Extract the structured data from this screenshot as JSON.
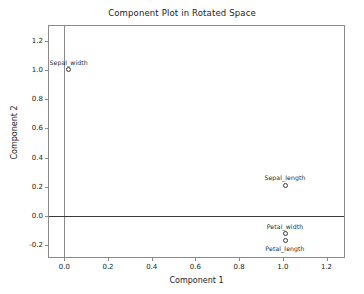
{
  "chart_data": {
    "type": "scatter",
    "title": "Component Plot in Rotated Space",
    "xlabel": "Component 1",
    "ylabel": "Component 2",
    "xlim": [
      -0.07,
      1.28
    ],
    "ylim": [
      -0.28,
      1.3
    ],
    "xticks": [
      "0.0",
      "0.2",
      "0.4",
      "0.6",
      "0.8",
      "1.0",
      "1.2"
    ],
    "xtick_values": [
      0.0,
      0.2,
      0.4,
      0.6,
      0.8,
      1.0,
      1.2
    ],
    "yticks": [
      "-0.2",
      "0.0",
      "0.2",
      "0.4",
      "0.6",
      "0.8",
      "1.0",
      "1.2"
    ],
    "ytick_values": [
      -0.2,
      0.0,
      0.2,
      0.4,
      0.6,
      0.8,
      1.0,
      1.2
    ],
    "grid": false,
    "legend": "none",
    "reference_lines": [
      {
        "axis": "x",
        "value": 0.0
      },
      {
        "axis": "y",
        "value": 0.0
      }
    ],
    "marker": "open-circle",
    "points": [
      {
        "label": "Sepal_width",
        "x": 0.02,
        "y": 1.0,
        "label_pos": "above"
      },
      {
        "label": "Sepal_length",
        "x": 1.01,
        "y": 0.21,
        "label_pos": "above"
      },
      {
        "label": "Petal_width",
        "x": 1.01,
        "y": -0.12,
        "label_pos": "above"
      },
      {
        "label": "Petal_length",
        "x": 1.01,
        "y": -0.17,
        "label_pos": "below"
      }
    ]
  },
  "colors": {
    "frame": "#8a8a8a",
    "reference_line": "#3a3a3a",
    "marker": "#3b3b3b",
    "text": "#232323",
    "background": "#ffffff"
  }
}
